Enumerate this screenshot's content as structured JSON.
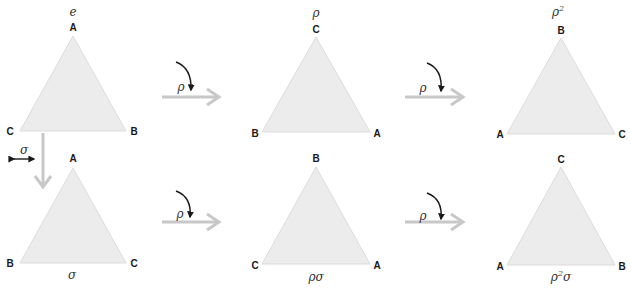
{
  "diagram": {
    "colors": {
      "triangle_fill": "#ececec",
      "triangle_edge": "#dcdcdc",
      "transform_arrow": "#c8c8c8",
      "rotation_arrow": "#1a1a1a",
      "vertex_label": "#1a1a1a",
      "element_label": "#333333"
    },
    "triangles": [
      {
        "id": "e",
        "label": "e",
        "label_pos": "top",
        "top": "A",
        "left": "C",
        "right": "B"
      },
      {
        "id": "rho",
        "label": "ρ",
        "label_pos": "top",
        "top": "C",
        "left": "B",
        "right": "A"
      },
      {
        "id": "rho2",
        "label": "ρ",
        "label_sup": "2",
        "label_pos": "top",
        "top": "B",
        "left": "A",
        "right": "C"
      },
      {
        "id": "sigma",
        "label": "σ",
        "label_pos": "bottom",
        "top": "A",
        "left": "B",
        "right": "C"
      },
      {
        "id": "rhosigma",
        "label": "ρσ",
        "label_pos": "bottom",
        "top": "B",
        "left": "C",
        "right": "A"
      },
      {
        "id": "rho2sigma",
        "label": "ρ",
        "label_sup": "2",
        "label_tail": "σ",
        "label_pos": "bottom",
        "top": "C",
        "left": "A",
        "right": "B"
      }
    ],
    "arrows": [
      {
        "from": "e",
        "to": "rho",
        "label": "ρ",
        "type": "rotation"
      },
      {
        "from": "rho",
        "to": "rho2",
        "label": "ρ",
        "type": "rotation"
      },
      {
        "from": "sigma",
        "to": "rhosigma",
        "label": "ρ",
        "type": "rotation"
      },
      {
        "from": "rhosigma",
        "to": "rho2sigma",
        "label": "ρ",
        "type": "rotation"
      },
      {
        "from": "e",
        "to": "sigma",
        "label": "σ",
        "type": "reflection"
      }
    ]
  }
}
